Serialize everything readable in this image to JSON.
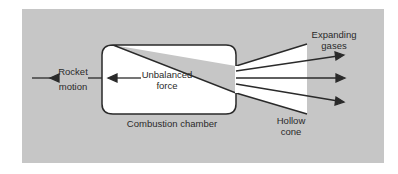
{
  "diagram": {
    "labels": {
      "rocket_motion_line1": "Rocket",
      "rocket_motion_line2": "motion",
      "unbalanced_force_line1": "Unbalanced",
      "unbalanced_force_line2": "force",
      "chamber": "Combustion chamber",
      "expanding_gases_line1": "Expanding",
      "expanding_gases_line2": "gases",
      "hollow_cone_line1": "Hollow",
      "hollow_cone_line2": "cone"
    },
    "colors": {
      "panel": "#c6c6c6",
      "chamber_fill": "#ffffff",
      "stroke": "#2a2a2a"
    }
  }
}
